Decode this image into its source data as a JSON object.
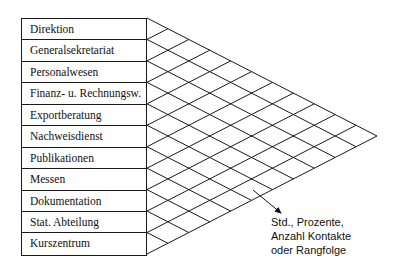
{
  "departments": [
    "Direktion",
    "Generalsekretariat",
    "Personalwesen",
    "Finanz- u. Rechnungsw.",
    "Exportberatung",
    "Nachweisdienst",
    "Publikationen",
    "Messen",
    "Dokumentation",
    "Stat. Abteilung",
    "Kurszentrum"
  ],
  "annotation": {
    "lines": [
      "Std., Prozente,",
      "Anzahl Kontakte",
      "oder Rangfolge"
    ]
  },
  "grid": {
    "left_x": 147,
    "top_y": 18,
    "bottom_y": 254,
    "tip_x": 377,
    "tip_y": 136,
    "divisions": 11,
    "line_color": "#1a1a1a"
  },
  "arrow": {
    "x1": 253,
    "y1": 190,
    "x2": 281,
    "y2": 213
  }
}
